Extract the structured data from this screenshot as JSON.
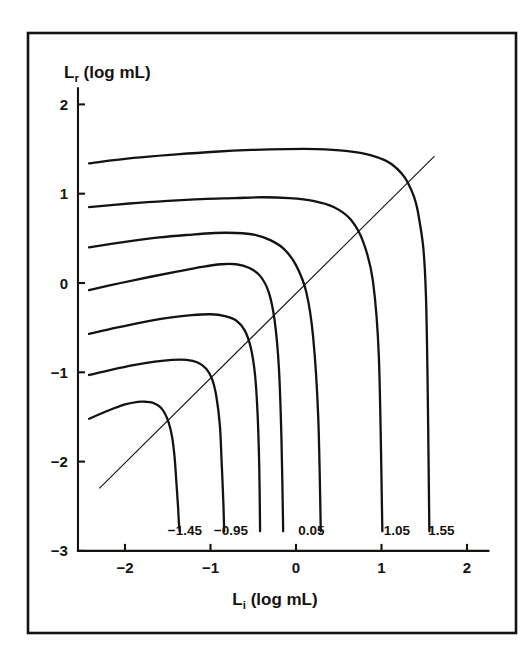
{
  "figure": {
    "background_color": "#ffffff",
    "ink_color": "#15130f",
    "frame": {
      "name": "outer-border",
      "x": 28,
      "y": 33,
      "width": 488,
      "height": 600,
      "stroke_width": 2.6
    }
  },
  "chart_data": {
    "type": "line",
    "title": "",
    "subtitle": "",
    "xlabel": "Lᵢ (log mL)",
    "xlabel_base": "L",
    "xlabel_sub": "i",
    "xlabel_rest": " (log mL)",
    "ylabel": "Lᵣ (log mL)",
    "ylabel_base": "L",
    "ylabel_sub": "r",
    "ylabel_rest": " (log mL)",
    "xlim": [
      -2.55,
      2.25
    ],
    "ylim": [
      -3.0,
      2.18
    ],
    "xticks": [
      -2,
      -1,
      0,
      1,
      2
    ],
    "xtick_labels": [
      "−2",
      "−1",
      "0",
      "1",
      "2"
    ],
    "yticks": [
      2,
      1,
      0,
      -1,
      -2,
      -3
    ],
    "ytick_labels": [
      "2",
      "1",
      "0",
      "−1",
      "−2",
      "−3"
    ],
    "grid": false,
    "legend_position": "none",
    "annotations": [
      {
        "name": "curve-label-neg-1-45",
        "text": "−1.45",
        "x_data": -1.3,
        "y_data": -2.82
      },
      {
        "name": "curve-label-neg-0-95",
        "text": "−0.95",
        "x_data": -0.76,
        "y_data": -2.82
      },
      {
        "name": "curve-label-0-05",
        "text": "0.05",
        "x_data": 0.18,
        "y_data": -2.82
      },
      {
        "name": "curve-label-1-05",
        "text": "1.05",
        "x_data": 1.18,
        "y_data": -2.82
      },
      {
        "name": "curve-label-1-55",
        "text": "1.55",
        "x_data": 1.7,
        "y_data": -2.82
      }
    ],
    "reference_line": {
      "name": "identity-line",
      "description": "y = x diagonal reference line",
      "x": [
        -2.3,
        1.62
      ],
      "y": [
        -2.3,
        1.42
      ],
      "stroke_width": 1.1
    },
    "series": [
      {
        "name": "curve-neg-1-45",
        "label": "−1.45",
        "stroke_width": 2.3,
        "x": [
          -2.42,
          -2.2,
          -2.0,
          -1.85,
          -1.76,
          -1.68,
          -1.6,
          -1.54,
          -1.49,
          -1.45,
          -1.42,
          -1.4,
          -1.38,
          -1.37,
          -1.36
        ],
        "y": [
          -1.52,
          -1.43,
          -1.36,
          -1.33,
          -1.33,
          -1.34,
          -1.38,
          -1.45,
          -1.56,
          -1.72,
          -1.95,
          -2.22,
          -2.5,
          -2.68,
          -2.78
        ]
      },
      {
        "name": "curve-neg-0-95",
        "label": "−0.95",
        "stroke_width": 2.3,
        "x": [
          -2.42,
          -2.15,
          -1.9,
          -1.65,
          -1.45,
          -1.28,
          -1.15,
          -1.05,
          -0.98,
          -0.93,
          -0.89,
          -0.87,
          -0.85,
          -0.84
        ],
        "y": [
          -1.03,
          -0.97,
          -0.92,
          -0.88,
          -0.86,
          -0.86,
          -0.89,
          -0.96,
          -1.08,
          -1.28,
          -1.6,
          -2.0,
          -2.45,
          -2.78
        ]
      },
      {
        "name": "curve-neg-0-45",
        "label": "−0.45",
        "stroke_width": 2.3,
        "x": [
          -2.42,
          -2.1,
          -1.8,
          -1.5,
          -1.22,
          -1.0,
          -0.83,
          -0.7,
          -0.6,
          -0.53,
          -0.48,
          -0.45,
          -0.43,
          -0.42
        ],
        "y": [
          -0.57,
          -0.5,
          -0.44,
          -0.39,
          -0.36,
          -0.35,
          -0.37,
          -0.42,
          -0.53,
          -0.72,
          -1.02,
          -1.45,
          -2.05,
          -2.78
        ]
      },
      {
        "name": "curve-0-05",
        "label": "0.05",
        "stroke_width": 2.3,
        "x": [
          -2.42,
          -2.05,
          -1.7,
          -1.38,
          -1.1,
          -0.88,
          -0.7,
          -0.55,
          -0.42,
          -0.32,
          -0.25,
          -0.2,
          -0.17,
          -0.15
        ],
        "y": [
          -0.08,
          0.0,
          0.07,
          0.13,
          0.18,
          0.21,
          0.21,
          0.17,
          0.08,
          -0.1,
          -0.42,
          -0.95,
          -1.75,
          -2.78
        ]
      },
      {
        "name": "curve-0-55",
        "label": "0.55",
        "stroke_width": 2.3,
        "x": [
          -2.42,
          -2.0,
          -1.6,
          -1.25,
          -0.95,
          -0.7,
          -0.48,
          -0.3,
          -0.14,
          0.0,
          0.12,
          0.2,
          0.26,
          0.29
        ],
        "y": [
          0.4,
          0.46,
          0.51,
          0.54,
          0.56,
          0.56,
          0.54,
          0.48,
          0.38,
          0.2,
          -0.1,
          -0.6,
          -1.5,
          -2.78
        ]
      },
      {
        "name": "curve-1-05",
        "label": "1.05",
        "stroke_width": 2.3,
        "x": [
          -2.42,
          -1.95,
          -1.5,
          -1.1,
          -0.72,
          -0.38,
          -0.08,
          0.2,
          0.44,
          0.64,
          0.79,
          0.9,
          0.97,
          1.01
        ],
        "y": [
          0.85,
          0.89,
          0.92,
          0.94,
          0.95,
          0.96,
          0.95,
          0.92,
          0.85,
          0.71,
          0.45,
          0.02,
          -0.85,
          -2.78
        ]
      },
      {
        "name": "curve-1-55",
        "label": "1.55",
        "stroke_width": 2.3,
        "x": [
          -2.42,
          -1.9,
          -1.4,
          -0.95,
          -0.52,
          -0.12,
          0.24,
          0.58,
          0.88,
          1.12,
          1.31,
          1.44,
          1.52,
          1.56
        ],
        "y": [
          1.34,
          1.4,
          1.44,
          1.47,
          1.49,
          1.5,
          1.5,
          1.48,
          1.43,
          1.33,
          1.12,
          0.72,
          -0.15,
          -2.78
        ]
      }
    ]
  }
}
